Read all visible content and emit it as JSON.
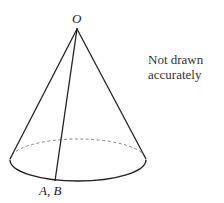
{
  "diagram": {
    "type": "cone",
    "apex_label": "O",
    "base_point_label": "A, B",
    "note_lines": [
      "Not drawn",
      "accurately"
    ],
    "colors": {
      "stroke": "#222222",
      "dashed": "#777777",
      "text": "#333333"
    }
  }
}
